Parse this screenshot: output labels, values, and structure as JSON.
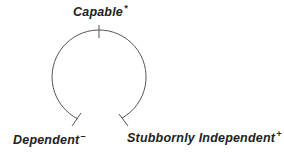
{
  "diagram": {
    "type": "open-circle-spectrum",
    "labels": {
      "top": {
        "text": "Capable",
        "mark": "*"
      },
      "left": {
        "text": "Dependent",
        "mark": "–"
      },
      "right": {
        "text": "Stubbornly Independent",
        "mark": "+"
      }
    },
    "colors": {
      "line": "#555555",
      "text": "#222222"
    }
  }
}
